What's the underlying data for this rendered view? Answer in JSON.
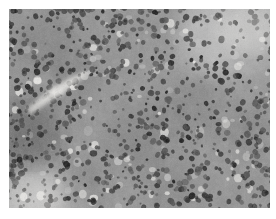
{
  "image": {
    "kind": "micrograph",
    "modality": "brightfield-light-microscopy",
    "stain": "hematoxylin-and-eosin",
    "rendering": "grayscale",
    "subject": "densely-cellular-tissue-section",
    "description": "Grayscale histopathology photomicrograph showing a sheet of densely packed small round cells with dark hyperchromatic nuclei and scant pale cytoplasm on a mottled gray background.",
    "frame": {
      "page_width": 276,
      "page_height": 219,
      "margin_left": 9,
      "margin_top": 9,
      "margin_right": 6,
      "margin_bottom": 11,
      "plate_width": 261,
      "plate_height": 199,
      "border": "none",
      "page_background": "#ffffff"
    },
    "tone": {
      "background_gray": "#8e8e8e",
      "mid_gray": "#9a9a9a",
      "light_gray": "#c8c8c8",
      "highlight": "#f0efec",
      "dark_gray": "#4a4a4a",
      "nucleus_dark": "#282828",
      "deep_black": "#101010",
      "mean_level": "#8c8c8c"
    },
    "features": [
      {
        "name": "nuclear-field",
        "label": "Dense field of small hyperchromatic nuclei",
        "coverage": "entire plate"
      },
      {
        "name": "pale-cleft",
        "label": "Bright diagonal cleft / vascular space",
        "region": "mid-left",
        "x": 18,
        "y": 62,
        "w": 62,
        "h": 38
      },
      {
        "name": "pale-zone-upper-right",
        "label": "Paler less cellular zone",
        "region": "upper-right",
        "x": 196,
        "y": 4,
        "w": 70,
        "h": 52
      },
      {
        "name": "pale-zone-lower-left",
        "label": "Pale edge / tissue margin",
        "region": "lower-left",
        "x": 2,
        "y": 160,
        "w": 56,
        "h": 44
      },
      {
        "name": "dark-band-lower-left",
        "label": "Dense dark cellular band",
        "region": "left-lower",
        "x": 2,
        "y": 96,
        "w": 46,
        "h": 62
      }
    ],
    "nuclei": {
      "count": 900,
      "min_radius": 1.1,
      "max_radius": 3.2,
      "shape": "round-to-oval",
      "distribution": "diffuse-uniformly-dense"
    },
    "vacuoles": {
      "count": 120,
      "label": "Pale perinuclear halos / clear cell spaces",
      "min_radius": 1.6,
      "max_radius": 4.4
    },
    "noise": {
      "grain": "fine photographic grain",
      "seed": 20240517
    }
  }
}
